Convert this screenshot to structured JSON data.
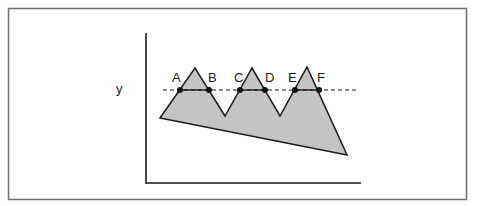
{
  "diagram": {
    "type": "polygon-with-level-line",
    "colors": {
      "frame": "#6e6e6e",
      "axis": "#1a1a1a",
      "polygon_fill": "#c4c4c4",
      "polygon_stroke": "#1a1a1a",
      "level_line": "#1a1a1a",
      "point": "#111111",
      "background": "#ffffff"
    },
    "level_line_label": "y",
    "polygon_vertices": [
      [
        160,
        118
      ],
      [
        195,
        68
      ],
      [
        225,
        116
      ],
      [
        252,
        68
      ],
      [
        280,
        116
      ],
      [
        307,
        67
      ],
      [
        347,
        155
      ]
    ],
    "level_y": 90,
    "points": [
      {
        "label": "A",
        "x": 180,
        "y": 90
      },
      {
        "label": "B",
        "x": 209,
        "y": 90
      },
      {
        "label": "C",
        "x": 240,
        "y": 90
      },
      {
        "label": "D",
        "x": 265,
        "y": 90
      },
      {
        "label": "E",
        "x": 295,
        "y": 90
      },
      {
        "label": "F",
        "x": 319,
        "y": 90
      }
    ],
    "segments_inside": [
      [
        "A",
        "B"
      ],
      [
        "C",
        "D"
      ],
      [
        "E",
        "F"
      ]
    ]
  }
}
